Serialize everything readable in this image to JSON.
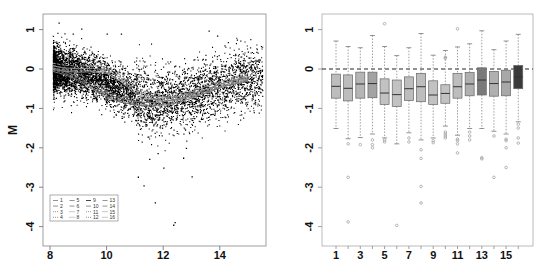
{
  "chart_data": [
    {
      "id": "ma-plot",
      "type": "scatter",
      "title": "",
      "xlabel": "",
      "ylabel": "M",
      "xlim": [
        7.8,
        15.7
      ],
      "ylim": [
        -4.2,
        1.4
      ],
      "x_ticks": [
        8,
        10,
        12,
        14
      ],
      "y_ticks": [
        1,
        0,
        -1,
        -2,
        -3,
        -4
      ],
      "grid": false,
      "point_color": "#000000",
      "scatter_description": "Dense cloud of ~6000 points (A vs M); dense band at A 8-11 around M 0 to -1, widening and sparser toward A 12-15.5; mean trend follows the loess curves",
      "outliers": [
        {
          "x": 8.3,
          "y": 1.18
        },
        {
          "x": 9.1,
          "y": 1.03
        },
        {
          "x": 8.8,
          "y": 0.9
        },
        {
          "x": 10.0,
          "y": 0.9
        },
        {
          "x": 10.5,
          "y": 0.9
        },
        {
          "x": 13.6,
          "y": 0.98
        },
        {
          "x": 13.9,
          "y": 0.85
        },
        {
          "x": 14.6,
          "y": 0.75
        },
        {
          "x": 11.1,
          "y": -2.73
        },
        {
          "x": 11.3,
          "y": -2.95
        },
        {
          "x": 11.7,
          "y": -3.38
        },
        {
          "x": 12.0,
          "y": -2.5
        },
        {
          "x": 13.0,
          "y": -2.72
        },
        {
          "x": 12.4,
          "y": -3.88
        },
        {
          "x": 12.35,
          "y": -3.95
        },
        {
          "x": 11.5,
          "y": -2.28
        },
        {
          "x": 11.8,
          "y": -2.13
        },
        {
          "x": 12.7,
          "y": -2.25
        },
        {
          "x": 12.8,
          "y": -2.0
        }
      ],
      "loess_curves": [
        {
          "name": "upper-group",
          "x": [
            8.1,
            8.5,
            9.0,
            9.5,
            10.0,
            10.5,
            11.0,
            11.5,
            12.0,
            12.5,
            13.0,
            13.5,
            14.0,
            14.5,
            15.0
          ],
          "y": [
            0.05,
            0.0,
            -0.02,
            -0.01,
            -0.05,
            -0.25,
            -0.55,
            -0.7,
            -0.75,
            -0.72,
            -0.65,
            -0.55,
            -0.42,
            -0.3,
            -0.22
          ]
        },
        {
          "name": "lower-group",
          "x": [
            8.1,
            8.5,
            9.0,
            9.5,
            10.0,
            10.5,
            11.0,
            11.5,
            12.0,
            12.5,
            13.0,
            13.5,
            14.0,
            14.5,
            15.0
          ],
          "y": [
            0.0,
            -0.08,
            -0.22,
            -0.45,
            -0.65,
            -0.78,
            -0.85,
            -0.88,
            -0.86,
            -0.8,
            -0.68,
            -0.55,
            -0.42,
            -0.32,
            -0.25
          ]
        }
      ],
      "legend": {
        "position": "bottom-left",
        "entries": [
          "1",
          "2",
          "3",
          "4",
          "5",
          "6",
          "7",
          "8",
          "9",
          "10",
          "11",
          "12",
          "13",
          "14",
          "15",
          "16"
        ],
        "columns": 4
      }
    },
    {
      "id": "boxplot",
      "type": "box",
      "title": "",
      "xlabel": "",
      "ylabel": "",
      "ylim": [
        -4.2,
        1.4
      ],
      "x_ticks": [
        1,
        3,
        5,
        7,
        9,
        11,
        13,
        15
      ],
      "y_ticks": [
        1,
        0,
        -1,
        -2,
        -3,
        -4
      ],
      "reference_line": {
        "y": 0,
        "style": "dashed"
      },
      "categories": [
        "1",
        "2",
        "3",
        "4",
        "5",
        "6",
        "7",
        "8",
        "9",
        "10",
        "11",
        "12",
        "13",
        "14",
        "15",
        "16"
      ],
      "boxes": [
        {
          "label": "1",
          "whisker_high": 0.71,
          "q3": -0.13,
          "median": -0.44,
          "q1": -0.74,
          "whisker_low": -1.51,
          "outliers": [],
          "color": "#bdbdbd"
        },
        {
          "label": "2",
          "whisker_high": 0.57,
          "q3": -0.15,
          "median": -0.49,
          "q1": -0.81,
          "whisker_low": -1.77,
          "outliers": [
            -1.9,
            -2.75,
            -3.88
          ],
          "color": "#bdbdbd"
        },
        {
          "label": "3",
          "whisker_high": 0.54,
          "q3": -0.08,
          "median": -0.38,
          "q1": -0.74,
          "whisker_low": -1.74,
          "outliers": [
            -1.92
          ],
          "color": "#b5b5b5"
        },
        {
          "label": "4",
          "whisker_high": 0.85,
          "q3": -0.08,
          "median": -0.37,
          "q1": -0.73,
          "whisker_low": -1.65,
          "outliers": [
            -1.8,
            -1.92,
            -2.0
          ],
          "color": "#a3a3a3"
        },
        {
          "label": "5",
          "whisker_high": 0.57,
          "q3": -0.25,
          "median": -0.61,
          "q1": -0.9,
          "whisker_low": -1.75,
          "outliers": [
            1.15,
            -1.8,
            -1.85
          ],
          "color": "#c2c2c2"
        },
        {
          "label": "6",
          "whisker_high": 0.34,
          "q3": -0.28,
          "median": -0.65,
          "q1": -0.95,
          "whisker_low": -1.9,
          "outliers": [
            -3.97
          ],
          "color": "#c2c2c2"
        },
        {
          "label": "7",
          "whisker_high": 0.54,
          "q3": -0.2,
          "median": -0.5,
          "q1": -0.8,
          "whisker_low": -1.62,
          "outliers": [
            -1.75,
            -1.85
          ],
          "color": "#bdbdbd"
        },
        {
          "label": "8",
          "whisker_high": 0.9,
          "q3": -0.11,
          "median": -0.45,
          "q1": -0.83,
          "whisker_low": -1.8,
          "outliers": [
            -2.05,
            -2.27,
            -2.98,
            -3.4
          ],
          "color": "#bdbdbd"
        },
        {
          "label": "9",
          "whisker_high": 0.35,
          "q3": -0.3,
          "median": -0.66,
          "q1": -0.9,
          "whisker_low": -1.75,
          "outliers": [
            -1.82,
            -1.87
          ],
          "color": "#c2c2c2"
        },
        {
          "label": "10",
          "whisker_high": 0.47,
          "q3": -0.4,
          "median": -0.62,
          "q1": -0.87,
          "whisker_low": -1.45,
          "outliers": [
            0.3,
            0.27,
            -1.6,
            -1.65,
            -1.7,
            -1.75
          ],
          "color": "#c2c2c2"
        },
        {
          "label": "11",
          "whisker_high": 0.56,
          "q3": -0.11,
          "median": -0.45,
          "q1": -0.74,
          "whisker_low": -1.68,
          "outliers": [
            1.02,
            -1.78,
            -1.82,
            -1.9,
            -2.13
          ],
          "color": "#bdbdbd"
        },
        {
          "label": "12",
          "whisker_high": 0.64,
          "q3": -0.09,
          "median": -0.38,
          "q1": -0.68,
          "whisker_low": -1.51,
          "outliers": [
            -1.6,
            -1.7,
            -1.8
          ],
          "color": "#b0b0b0"
        },
        {
          "label": "13",
          "whisker_high": 0.97,
          "q3": 0.03,
          "median": -0.28,
          "q1": -0.66,
          "whisker_low": -1.51,
          "outliers": [
            -2.25,
            -2.28
          ],
          "color": "#7a7a7a"
        },
        {
          "label": "14",
          "whisker_high": 0.49,
          "q3": -0.06,
          "median": -0.37,
          "q1": -0.69,
          "whisker_low": -1.58,
          "outliers": [
            -1.7,
            -2.75
          ],
          "color": "#b0b0b0"
        },
        {
          "label": "15",
          "whisker_high": 0.71,
          "q3": -0.03,
          "median": -0.33,
          "q1": -0.68,
          "whisker_low": -1.65,
          "outliers": [
            -1.78,
            -1.82,
            -2.0,
            -2.5
          ],
          "color": "#a8a8a8"
        },
        {
          "label": "16",
          "whisker_high": 0.88,
          "q3": 0.09,
          "median": -0.2,
          "q1": -0.5,
          "whisker_low": -1.34,
          "outliers": [
            -1.4,
            -1.5,
            -1.75,
            -1.88
          ],
          "color": "#3a3a3a"
        }
      ]
    }
  ]
}
